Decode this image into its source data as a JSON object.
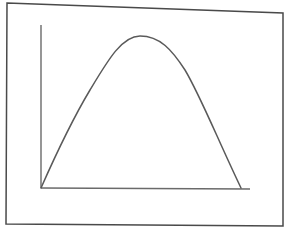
{
  "diagram": {
    "type": "curve-sketch",
    "colors": {
      "background": "#ffffff",
      "frame": "#4a4a4a",
      "axis": "#6a6a6a",
      "curve": "#5a5a5a"
    },
    "frame": {
      "points": "7,3 283,13 283,226 6,224"
    },
    "axes": {
      "y_axis": {
        "x1": 41,
        "y1": 25,
        "x2": 41,
        "y2": 188
      },
      "x_axis": {
        "x1": 41,
        "y1": 188,
        "x2": 250,
        "y2": 189
      },
      "x_label": "",
      "y_label": ""
    },
    "curve": {
      "path": "M41,188 C60,145 72,120 90,90 C108,60 122,36 140,36 C160,36 172,50 185,70 C200,95 218,140 241,188",
      "start": [
        41,
        188
      ],
      "peak": [
        140,
        36
      ],
      "end": [
        241,
        188
      ]
    }
  }
}
